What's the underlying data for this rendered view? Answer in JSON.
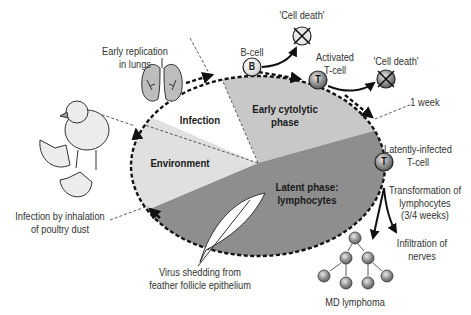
{
  "diagram": {
    "phases": [
      {
        "id": "infection",
        "label": "Infection",
        "color": "#ffffff"
      },
      {
        "id": "early",
        "label": "Early cytolytic phase",
        "line1": "Early cytolytic",
        "line2": "phase",
        "color": "#c8c8c8"
      },
      {
        "id": "latent",
        "label": "Latent phase: lymphocytes",
        "line1": "Latent phase:",
        "line2": "lymphocytes",
        "color": "#8e8e8e"
      },
      {
        "id": "environment",
        "label": "Environment",
        "color": "#e0e0e0"
      }
    ],
    "annotations": {
      "early_replication": {
        "line1": "Early replication",
        "line2": "in lungs"
      },
      "b_cell": {
        "label": "B-cell",
        "glyph": "B"
      },
      "cell_death_1": "'Cell death'",
      "activated_t": {
        "line1": "Activated",
        "line2": "T-cell",
        "glyph": "T"
      },
      "cell_death_2": "'Cell death'",
      "one_week": "1 week",
      "latent_t": {
        "line1": "Latently-infected",
        "line2": "T-cell",
        "glyph": "T"
      },
      "transformation": {
        "line1": "Transformation of",
        "line2": "lymphocytes",
        "line3": "(3/4 weeks)"
      },
      "infiltration": {
        "line1": "Infiltration of",
        "line2": "nerves"
      },
      "md_lymphoma": "MD lymphoma",
      "shedding": {
        "line1": "Virus shedding from",
        "line2": "feather follicle epithelium"
      },
      "inhalation": {
        "line1": "Infection by inhalation",
        "line2": "of poultry dust"
      }
    },
    "icons": [
      "lungs-icon",
      "chick-icon",
      "feather-icon",
      "cell-death-icon",
      "lymphoma-cluster-icon"
    ]
  }
}
